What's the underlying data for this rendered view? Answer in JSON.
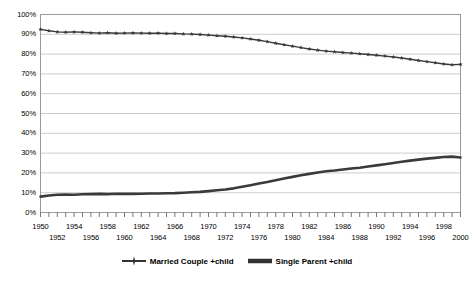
{
  "chart_data": {
    "type": "line",
    "title": "",
    "xlabel": "",
    "ylabel": "",
    "xlim": [
      1950,
      2000
    ],
    "ylim": [
      0,
      100
    ],
    "grid": true,
    "legend_position": "bottom",
    "y_ticks": [
      "0%",
      "10%",
      "20%",
      "30%",
      "40%",
      "50%",
      "60%",
      "70%",
      "80%",
      "90%",
      "100%"
    ],
    "y_tick_values": [
      0,
      10,
      20,
      30,
      40,
      50,
      60,
      70,
      80,
      90,
      100
    ],
    "x_tick_labels_top": [
      "1950",
      "1954",
      "1958",
      "1962",
      "1966",
      "1970",
      "1974",
      "1978",
      "1982",
      "1986",
      "1990",
      "1994",
      "1998"
    ],
    "x_tick_labels_bottom": [
      "1952",
      "1956",
      "1960",
      "1964",
      "1968",
      "1972",
      "1976",
      "1980",
      "1984",
      "1988",
      "1992",
      "1996",
      "2000"
    ],
    "x": [
      1950,
      1951,
      1952,
      1953,
      1954,
      1955,
      1956,
      1957,
      1958,
      1959,
      1960,
      1961,
      1962,
      1963,
      1964,
      1965,
      1966,
      1967,
      1968,
      1969,
      1970,
      1971,
      1972,
      1973,
      1974,
      1975,
      1976,
      1977,
      1978,
      1979,
      1980,
      1981,
      1982,
      1983,
      1984,
      1985,
      1986,
      1987,
      1988,
      1989,
      1990,
      1991,
      1992,
      1993,
      1994,
      1995,
      1996,
      1997,
      1998,
      1999,
      2000
    ],
    "series": [
      {
        "name": "Married Couple +child",
        "color": "#3a3a3a",
        "marker": "star",
        "values": [
          92.5,
          91.8,
          91.2,
          91.0,
          91.2,
          91.0,
          90.8,
          90.6,
          90.8,
          90.5,
          90.6,
          90.7,
          90.6,
          90.5,
          90.6,
          90.4,
          90.4,
          90.2,
          90.1,
          89.9,
          89.6,
          89.3,
          89.0,
          88.6,
          88.2,
          87.6,
          87.0,
          86.3,
          85.5,
          84.7,
          84.0,
          83.3,
          82.6,
          82.0,
          81.5,
          81.2,
          80.8,
          80.5,
          80.2,
          79.8,
          79.4,
          79.0,
          78.5,
          78.0,
          77.4,
          76.8,
          76.2,
          75.6,
          75.0,
          74.6,
          74.8
        ]
      },
      {
        "name": "Single Parent +child",
        "color": "#3a3a3a",
        "marker": "none",
        "values": [
          8.0,
          8.6,
          9.0,
          9.1,
          9.0,
          9.2,
          9.3,
          9.4,
          9.3,
          9.5,
          9.4,
          9.4,
          9.5,
          9.6,
          9.6,
          9.7,
          9.8,
          10.0,
          10.2,
          10.4,
          10.8,
          11.2,
          11.6,
          12.2,
          13.0,
          13.8,
          14.6,
          15.4,
          16.3,
          17.2,
          18.0,
          18.8,
          19.5,
          20.2,
          20.8,
          21.2,
          21.7,
          22.2,
          22.6,
          23.2,
          23.8,
          24.4,
          25.0,
          25.6,
          26.2,
          26.7,
          27.2,
          27.6,
          28.0,
          28.2,
          27.8
        ]
      }
    ]
  },
  "legend": {
    "entries": [
      {
        "label": "Married Couple +child",
        "marker": "star-line"
      },
      {
        "label": "Single Parent +child",
        "marker": "thick-line"
      }
    ]
  },
  "colors": {
    "plot_border": "#9a9a9a",
    "gridline": "#c0c0c0",
    "series": "#333333",
    "background": "#ffffff"
  }
}
